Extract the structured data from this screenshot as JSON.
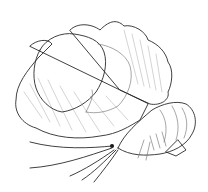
{
  "illustration": {
    "subject": "scallop-and-prawn",
    "style": "stippled pen-and-ink",
    "colors": {
      "background": "#ffffff",
      "ink": "#2a2a2a",
      "stipple": "#6a6a6a",
      "faint": "#a8a8a8"
    }
  }
}
